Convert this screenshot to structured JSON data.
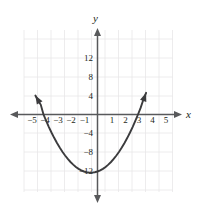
{
  "chart_data": {
    "type": "line",
    "title": "",
    "subtitle": "",
    "xlabel": "x",
    "ylabel": "y",
    "xlim": [
      -6,
      6
    ],
    "ylim": [
      -14,
      15
    ],
    "grid": true,
    "legend": null,
    "x_ticks": [
      -5,
      -4,
      -3,
      -2,
      -1,
      1,
      2,
      3,
      4,
      5
    ],
    "x_tick_labels": [
      "−5",
      "−4",
      "−3",
      "−2",
      "−1",
      "1",
      "2",
      "3",
      "4",
      "5"
    ],
    "y_ticks": [
      12,
      8,
      4,
      -4,
      -8,
      -12
    ],
    "y_tick_labels": [
      "12",
      "8",
      "4",
      "−4",
      "−8",
      "−12"
    ],
    "x_grid_step": 1,
    "y_grid_step": 4,
    "series": [
      {
        "name": "parabola",
        "equation": "y = x^2 + x - 12",
        "color": "#3b3b3d",
        "vertex": [
          -0.5,
          -12.25
        ],
        "roots": [
          -4,
          3
        ],
        "y_intercept": -12,
        "arrow_start": true,
        "arrow_end": true,
        "x": [
          -4.6,
          -4.4,
          -4.2,
          -4.0,
          -3.8,
          -3.6,
          -3.4,
          -3.2,
          -3.0,
          -2.8,
          -2.6,
          -2.4,
          -2.2,
          -2.0,
          -1.8,
          -1.6,
          -1.4,
          -1.2,
          -1.0,
          -0.8,
          -0.6,
          -0.5,
          -0.4,
          -0.2,
          0.0,
          0.2,
          0.4,
          0.6,
          0.8,
          1.0,
          1.2,
          1.4,
          1.6,
          1.8,
          2.0,
          2.2,
          2.4,
          2.6,
          2.8,
          3.0,
          3.2,
          3.4,
          3.6
        ],
        "y": [
          4.0,
          2.96,
          2.04,
          0.0,
          -1.36,
          -2.64,
          -3.84,
          -4.96,
          -6.0,
          -6.96,
          -7.84,
          -8.64,
          -9.36,
          -10.0,
          -10.56,
          -11.04,
          -11.44,
          -11.76,
          -12.0,
          -12.16,
          -12.24,
          -12.25,
          -12.24,
          -12.16,
          -12.0,
          -11.76,
          -11.44,
          -11.04,
          -10.56,
          -10.0,
          -9.36,
          -8.64,
          -7.84,
          -6.96,
          -6.0,
          -4.96,
          -3.84,
          -2.64,
          -1.36,
          0.0,
          1.44,
          3.16,
          4.56
        ]
      }
    ]
  },
  "axis_labels": {
    "x": "x",
    "y": "y"
  }
}
